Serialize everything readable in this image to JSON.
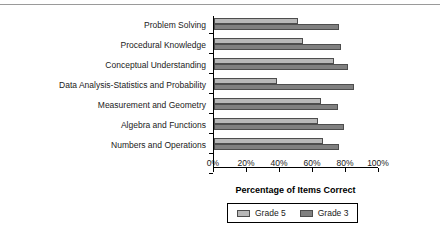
{
  "chart_data": {
    "type": "bar",
    "orientation": "horizontal",
    "title": "",
    "xlabel": "Percentage of Items Correct",
    "ylabel": "",
    "xlim": [
      0,
      100
    ],
    "xticks": [
      "0%",
      "20%",
      "40%",
      "60%",
      "80%",
      "100%"
    ],
    "xtick_values": [
      0,
      20,
      40,
      60,
      80,
      100
    ],
    "grid": false,
    "legend_position": "bottom",
    "categories": [
      "Problem Solving",
      "Procedural Knowledge",
      "Conceptual Understanding",
      "Data Analysis-Statistics and Probability",
      "Measurement and Geometry",
      "Algebra and Functions",
      "Numbers and Operations"
    ],
    "series": [
      {
        "name": "Grade 5",
        "color": "#b8b8b8",
        "values": [
          51,
          54,
          73,
          38,
          65,
          63,
          66
        ]
      },
      {
        "name": "Grade 3",
        "color": "#808080",
        "values": [
          76,
          77,
          81,
          85,
          75,
          79,
          76
        ]
      }
    ]
  },
  "legend": {
    "entries": [
      {
        "label": "Grade 5"
      },
      {
        "label": "Grade 3"
      }
    ]
  }
}
